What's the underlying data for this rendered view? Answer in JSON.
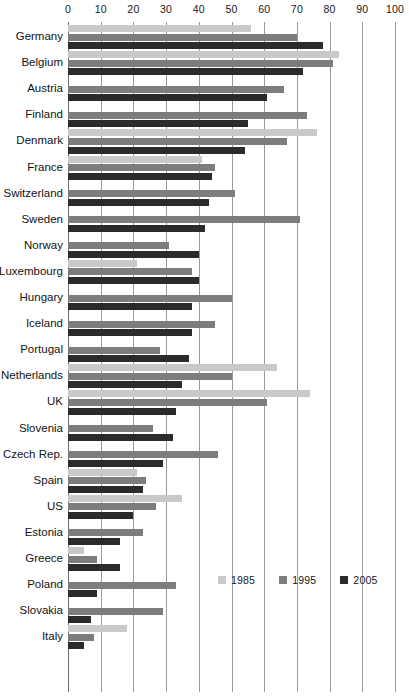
{
  "chart_data": {
    "type": "bar",
    "orientation": "horizontal",
    "title": "",
    "xlabel": "",
    "ylabel": "",
    "xlim": [
      0,
      100
    ],
    "xticks": [
      0,
      10,
      20,
      30,
      40,
      50,
      60,
      70,
      80,
      90,
      100
    ],
    "grid": true,
    "legend_position": "bottom-right",
    "legend": [
      "1985",
      "1995",
      "2005"
    ],
    "series_colors": {
      "1985": "#c9c9c9",
      "1995": "#7d7d7d",
      "2005": "#2b2b2b"
    },
    "categories": [
      "Germany",
      "Belgium",
      "Austria",
      "Finland",
      "Denmark",
      "France",
      "Switzerland",
      "Sweden",
      "Norway",
      "Luxembourg",
      "Hungary",
      "Iceland",
      "Portugal",
      "Netherlands",
      "UK",
      "Slovenia",
      "Czech Rep.",
      "Spain",
      "US",
      "Estonia",
      "Greece",
      "Poland",
      "Slovakia",
      "Italy"
    ],
    "series": [
      {
        "name": "1985",
        "values": [
          56,
          83,
          null,
          null,
          76,
          41,
          null,
          null,
          null,
          21,
          null,
          null,
          null,
          64,
          74,
          null,
          null,
          21,
          35,
          null,
          5,
          null,
          null,
          18
        ]
      },
      {
        "name": "1995",
        "values": [
          70,
          81,
          66,
          73,
          67,
          45,
          51,
          71,
          31,
          38,
          50,
          45,
          28,
          50,
          61,
          26,
          46,
          24,
          27,
          23,
          9,
          33,
          29,
          8
        ]
      },
      {
        "name": "2005",
        "values": [
          78,
          72,
          61,
          55,
          54,
          44,
          43,
          42,
          40,
          40,
          38,
          38,
          37,
          35,
          33,
          32,
          29,
          23,
          20,
          16,
          16,
          9,
          7,
          5
        ]
      }
    ]
  },
  "legend": {
    "items": [
      {
        "label": "1985",
        "key": "y1985"
      },
      {
        "label": "1995",
        "key": "y1995"
      },
      {
        "label": "2005",
        "key": "y2005"
      }
    ]
  }
}
